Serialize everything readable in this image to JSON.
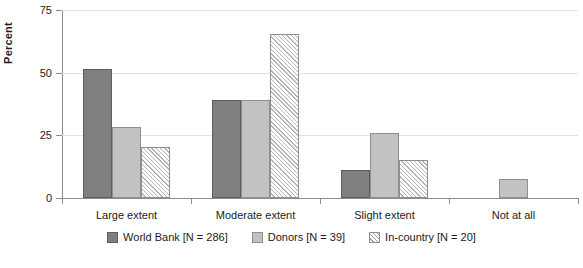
{
  "chart_data": {
    "type": "bar",
    "title": "",
    "xlabel": "",
    "ylabel": "Percent",
    "ylim": [
      0,
      75
    ],
    "yticks": [
      0,
      25,
      50,
      75
    ],
    "ytick_labels": [
      "0",
      "25",
      "50",
      "75"
    ],
    "grid": true,
    "legend_position": "bottom",
    "categories": [
      "Large extent",
      "Moderate extent",
      "Slight extent",
      "Not at all"
    ],
    "series": [
      {
        "name": "World Bank [N = 286]",
        "label": "World Bank",
        "n": 286,
        "style": "solid-dark-gray",
        "color": "#7f7f7f",
        "values": [
          51.5,
          39,
          11,
          0
        ]
      },
      {
        "name": "Donors [N = 39]",
        "label": "Donors",
        "n": 39,
        "style": "solid-light-gray",
        "color": "#c2c2c2",
        "values": [
          28.5,
          39,
          26,
          7.5
        ]
      },
      {
        "name": "In-country [N = 20]",
        "label": "In-country",
        "n": 20,
        "style": "diagonal-hatch",
        "color": "#ffffff",
        "values": [
          20.5,
          65.5,
          15,
          0
        ]
      }
    ]
  }
}
